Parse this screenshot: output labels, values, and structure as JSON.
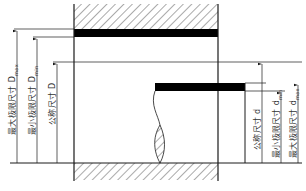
{
  "diagram": {
    "type": "hole-shaft limit dimensions",
    "colors": {
      "line": "#1a1a1a",
      "hatch": "#555555",
      "band": "#000000",
      "text": "#333333"
    },
    "hole_labels": [
      {
        "id": "Dmax",
        "text": "最大极限尺寸 D",
        "sub": "max"
      },
      {
        "id": "Dmin",
        "text": "最小极限尺寸 D",
        "sub": "min"
      },
      {
        "id": "D",
        "text": "公称尺寸 D",
        "sub": ""
      }
    ],
    "shaft_labels": [
      {
        "id": "d",
        "text": "公称尺寸 d",
        "sub": ""
      },
      {
        "id": "dmin",
        "text": "最小极限尺寸 d",
        "sub": "min"
      },
      {
        "id": "dmax",
        "text": "最大极限尺寸 d",
        "sub": "max"
      }
    ]
  }
}
